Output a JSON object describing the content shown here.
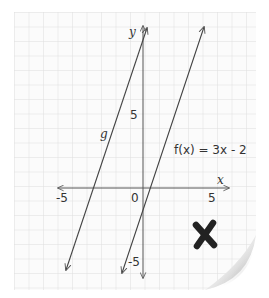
{
  "diagram": {
    "type": "coordinate-graph-on-grid-paper",
    "axes": {
      "x_label": "x",
      "y_label": "y",
      "x_ticks": [
        {
          "value": -5,
          "label": "-5"
        },
        {
          "value": 0,
          "label": "0"
        },
        {
          "value": 5,
          "label": "5"
        }
      ],
      "y_ticks": [
        {
          "value": 5,
          "label": "5"
        },
        {
          "value": -5,
          "label": "-5"
        }
      ],
      "x_range": [
        -6,
        6
      ],
      "y_range": [
        -6,
        11
      ]
    },
    "lines": [
      {
        "name": "g",
        "label": "g",
        "slope": 3,
        "description": "parallel to f, shifted left"
      },
      {
        "name": "f",
        "label": "f(x) = 3x - 2",
        "slope": 3,
        "intercept": -2
      }
    ],
    "marks": {
      "result_icon": "cross-mark-icon",
      "result_color": "#222222"
    },
    "colors": {
      "grid": "#dcdcdc",
      "axis": "#555555",
      "line": "#444444",
      "paper": "#fdfdfd",
      "shadow": "#bdbdbd"
    }
  }
}
